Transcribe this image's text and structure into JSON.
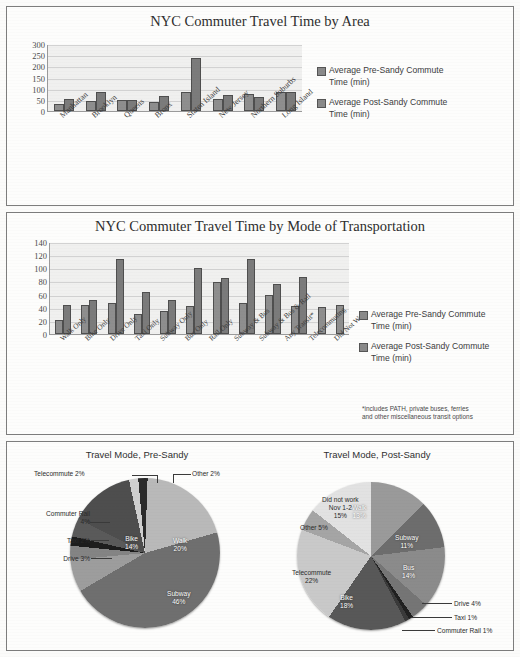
{
  "document": {
    "background_color": "#fbfbfa",
    "panel_border_color": "#7d7d7d"
  },
  "chart_data": [
    {
      "type": "bar",
      "id": "travel-time-by-area",
      "title": "NYC Commuter Travel Time by Area",
      "xlabel": "",
      "ylabel": "",
      "ylim": [
        0,
        300
      ],
      "yticks": [
        "0",
        "50",
        "100",
        "150",
        "200",
        "250",
        "300"
      ],
      "grid": true,
      "legend_position": "right",
      "categories": [
        "Manhattan",
        "Brooklyn",
        "Queens",
        "Bronx",
        "Staten Island",
        "New Jersey",
        "Northern Suburbs",
        "Long Island"
      ],
      "series": [
        {
          "name": "Average Pre-Sandy Commute Time (min)",
          "color": "#8e8e8e",
          "values": [
            30,
            44,
            50,
            43,
            86,
            54,
            77,
            87
          ]
        },
        {
          "name": "Average Post-Sandy Commute Time (min)",
          "color": "#7b7b7b",
          "values": [
            53,
            85,
            50,
            67,
            243,
            74,
            64,
            87
          ]
        }
      ]
    },
    {
      "type": "bar",
      "id": "travel-time-by-mode",
      "title": "NYC Commuter Travel Time by Mode of Transportation",
      "xlabel": "",
      "ylabel": "",
      "ylim": [
        0,
        140
      ],
      "yticks": [
        "0",
        "20",
        "40",
        "60",
        "80",
        "100",
        "120",
        "140"
      ],
      "grid": true,
      "legend_position": "right",
      "footnote": "*includes PATH, private buses, ferries and other miscellaneous transit options",
      "categories": [
        "Walk Only",
        "Bike Only",
        "Drive Only",
        "Taxi Only",
        "Subway Only",
        "Bus Only",
        "Rail Only",
        "Subway & Bus",
        "Subway & Bus & Rail",
        "Any Transit*",
        "Telecommuting",
        "Did Not Work"
      ],
      "series": [
        {
          "name": "Average Pre-Sandy Commute Time (min)",
          "color": "#8e8e8e",
          "values": [
            22,
            44,
            48,
            31,
            35,
            43,
            80,
            47,
            60,
            43,
            42,
            44
          ]
        },
        {
          "name": "Average Post-Sandy Commute Time (min)",
          "color": "#7b7b7b",
          "values": [
            45,
            53,
            115,
            65,
            53,
            101,
            86,
            116,
            77,
            88,
            0,
            0
          ]
        }
      ]
    },
    {
      "type": "pie",
      "id": "travel-mode-pre-sandy",
      "title": "Travel Mode, Pre-Sandy",
      "labels": [
        "Walk",
        "Subway",
        "Bus",
        "Drive",
        "Taxi",
        "Commuter Rail",
        "Bike",
        "Telecommute",
        "Other"
      ],
      "values": [
        20,
        46,
        7,
        3,
        2,
        4,
        14,
        2,
        2
      ],
      "display_labels": [
        "Walk 20%",
        "Subway 46%",
        "Bus 7%",
        "Drive 3%",
        "Taxi 2%",
        "Commuter Rail 4%",
        "Bike 14%",
        "Telecommute 2%",
        "Other 2%"
      ],
      "colors": [
        "#b9b9b9",
        "#6f6f6f",
        "#9d9d9d",
        "#848484",
        "#1d1d1d",
        "#5a5a5a",
        "#4e4e4e",
        "#cfcfcf",
        "#2a2a2a"
      ]
    },
    {
      "type": "pie",
      "id": "travel-mode-post-sandy",
      "title": "Travel Mode, Post-Sandy",
      "labels": [
        "Walk",
        "Subway",
        "Bus",
        "Drive",
        "Taxi",
        "Commuter Rail",
        "Bike",
        "Telecommute",
        "Other",
        "Did not work Nov 1-2"
      ],
      "values": [
        13,
        11,
        14,
        4,
        1,
        1,
        18,
        22,
        5,
        15
      ],
      "display_labels": [
        "Walk 13%",
        "Subway 11%",
        "Bus 14%",
        "Drive 4%",
        "Taxi 1%",
        "Commuter Rail 1%",
        "Bike 18%",
        "Telecommute 22%",
        "Other 5%",
        "Did not work Nov 1-2 15%"
      ],
      "colors": [
        "#9a9a9a",
        "#6d6d6d",
        "#8b8b8b",
        "#757575",
        "#202020",
        "#3a3a3a",
        "#585858",
        "#c9c9c9",
        "#a5a5a5",
        "#e2e2e2"
      ]
    }
  ],
  "panel1": {
    "title": "NYC Commuter Travel Time by Area",
    "yticks": [
      "300",
      "250",
      "200",
      "150",
      "100",
      "50",
      "0"
    ],
    "categories": [
      "Manhattan",
      "Brooklyn",
      "Queens",
      "Bronx",
      "Staten Island",
      "New Jersey",
      "Northern Suburbs",
      "Long Island"
    ],
    "legend": [
      "Average Pre-Sandy Commute Time (min)",
      "Average Post-Sandy Commute Time (min)"
    ]
  },
  "panel2": {
    "title": "NYC Commuter Travel Time by Mode of Transportation",
    "yticks": [
      "140",
      "120",
      "100",
      "80",
      "60",
      "40",
      "20",
      "0"
    ],
    "categories": [
      "Walk Only",
      "Bike Only",
      "Drive Only",
      "Taxi Only",
      "Subway Only",
      "Bus Only",
      "Rail Only",
      "Subway & Bus",
      "Subway & Bus & Rail",
      "Any Transit*",
      "Telecommuting",
      "Did Not Work"
    ],
    "legend": [
      "Average Pre-Sandy Commute Time (min)",
      "Average Post-Sandy Commute Time (min)"
    ],
    "footnote_line1": "*includes PATH, private buses, ferries",
    "footnote_line2": "and other miscellaneous transit options"
  },
  "panel3": {
    "left_title": "Travel Mode, Pre-Sandy",
    "right_title": "Travel Mode, Post-Sandy",
    "left_labels": {
      "walk": "Walk\n20%",
      "walk_l1": "Walk",
      "walk_l2": "20%",
      "subway_l1": "Subway",
      "subway_l2": "46%",
      "bus_l1": "Bus",
      "bus_l2": "7%",
      "bike_l1": "Bike",
      "bike_l2": "14%",
      "telecommute": "Telecommute 2%",
      "other": "Other 2%",
      "commuter_rail_l1": "Commuter Rail",
      "commuter_rail_l2": "4%",
      "taxi": "Taxi 2%",
      "drive": "Drive 3%"
    },
    "right_labels": {
      "walk_l1": "Walk",
      "walk_l2": "13%",
      "subway_l1": "Subway",
      "subway_l2": "11%",
      "bus_l1": "Bus",
      "bus_l2": "14%",
      "bike_l1": "Bike",
      "bike_l2": "18%",
      "telecommute_l1": "Telecommute",
      "telecommute_l2": "22%",
      "other": "Other 5%",
      "didnotwork_l1": "Did not work",
      "didnotwork_l2": "Nov 1-2",
      "didnotwork_l3": "15%",
      "drive": "Drive 4%",
      "taxi": "Taxi 1%",
      "commuter_rail": "Commuter Rail 1%"
    }
  }
}
